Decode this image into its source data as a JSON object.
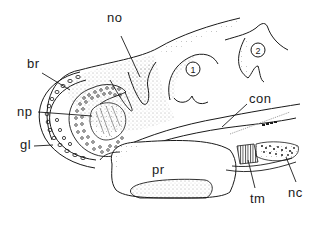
{
  "figure": {
    "type": "anatomical-section-drawing",
    "labels": [
      {
        "id": "no",
        "text": "no",
        "x": 107,
        "y": 11
      },
      {
        "id": "br",
        "text": "br",
        "x": 27,
        "y": 57
      },
      {
        "id": "np",
        "text": "np",
        "x": 17,
        "y": 105
      },
      {
        "id": "gl",
        "text": "gl",
        "x": 20,
        "y": 144
      },
      {
        "id": "con",
        "text": "con",
        "x": 249,
        "y": 96
      },
      {
        "id": "pr",
        "text": "pr",
        "x": 152,
        "y": 163
      },
      {
        "id": "tm",
        "text": "tm",
        "x": 250,
        "y": 196
      },
      {
        "id": "nc",
        "text": "nc",
        "x": 288,
        "y": 190
      }
    ],
    "numbered_regions": [
      {
        "number": "1",
        "cx": 193,
        "cy": 69
      },
      {
        "number": "2",
        "cx": 258,
        "cy": 50
      }
    ]
  },
  "colors": {
    "ink": "#1a1a1a",
    "stipple": "#555555",
    "background": "#ffffff"
  }
}
